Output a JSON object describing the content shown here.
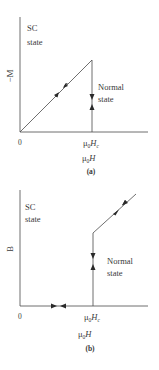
{
  "panels": [
    {
      "id": "a",
      "caption": "(a)",
      "y_axis_label": "−M",
      "x_axis_label": "μ0H",
      "x_axis_label_parts": {
        "mu": "μ",
        "sub": "0",
        "var": "H"
      },
      "origin_label": "0",
      "critical_field_label": {
        "mu": "μ",
        "sub": "0",
        "var": "H",
        "varsub": "c"
      },
      "regions": [
        {
          "line1": "SC",
          "line2": "state"
        },
        {
          "line1": "Normal",
          "line2": "state"
        }
      ]
    },
    {
      "id": "b",
      "caption": "(b)",
      "y_axis_label": "B",
      "x_axis_label": "μ0H",
      "x_axis_label_parts": {
        "mu": "μ",
        "sub": "0",
        "var": "H"
      },
      "origin_label": "0",
      "critical_field_label": {
        "mu": "μ",
        "sub": "0",
        "var": "H",
        "varsub": "c"
      },
      "regions": [
        {
          "line1": "SC",
          "line2": "state"
        },
        {
          "line1": "Normal",
          "line2": "state"
        }
      ]
    }
  ],
  "colors": {
    "line": "#3a3a3a",
    "text": "#3a3a3a",
    "background": "#ffffff"
  }
}
